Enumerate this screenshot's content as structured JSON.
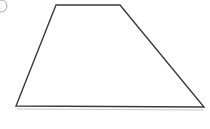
{
  "canvas": {
    "width": 210,
    "height": 129,
    "background_color": "#ffffff"
  },
  "figure": {
    "name": "trapezoid",
    "label": "Trapezoid",
    "stroke_color": "#3b3b3b",
    "stroke_width": 1.4,
    "fill_color": "#ffffff",
    "vertices": [
      {
        "name": "top-left",
        "x": 56,
        "y": 5
      },
      {
        "name": "top-right",
        "x": 120,
        "y": 5
      },
      {
        "name": "bottom-right",
        "x": 204,
        "y": 107
      },
      {
        "name": "bottom-left",
        "x": 16,
        "y": 106
      }
    ],
    "edges": [
      {
        "name": "top-edge",
        "from": "top-left",
        "to": "top-right"
      },
      {
        "name": "right-edge",
        "from": "top-right",
        "to": "bottom-right"
      },
      {
        "name": "bottom-edge",
        "from": "bottom-right",
        "to": "bottom-left"
      },
      {
        "name": "left-edge",
        "from": "bottom-left",
        "to": "top-left"
      }
    ]
  },
  "shadow": {
    "name": "base-shadow",
    "color": "#c8c8c8",
    "stroke_width": 1,
    "x1": 17,
    "y1": 109,
    "x2": 203,
    "y2": 110
  },
  "marker": {
    "name": "option-bullet",
    "shape": "circle-outline",
    "stroke_color": "#aaaaaa",
    "stroke_width": 1,
    "center_x": 1,
    "center_y": 6,
    "radius": 6
  }
}
